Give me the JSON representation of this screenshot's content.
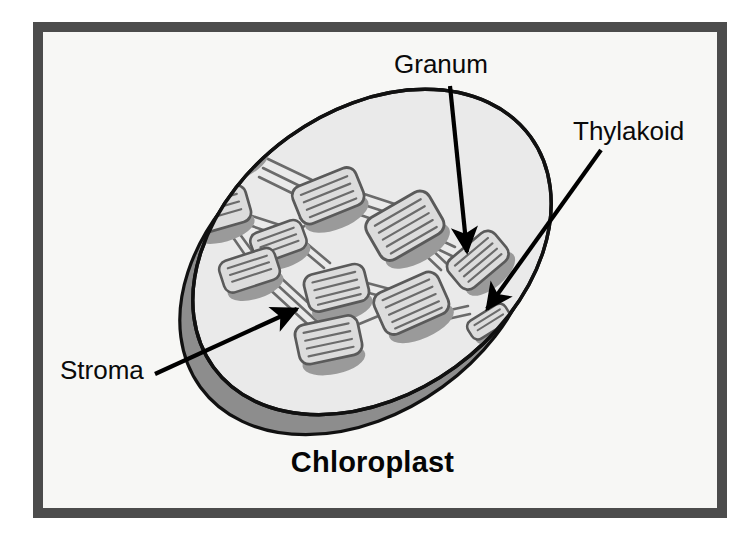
{
  "figure": {
    "title": "Chloroplast",
    "caption": "Chloroplast",
    "frame": {
      "border_color": "#4c4c4c",
      "background_color": "#f7f7f5",
      "page_background": "#ffffff"
    }
  },
  "labels": {
    "granum": "Granum",
    "thylakoid": "Thylakoid",
    "stroma": "Stroma"
  },
  "annotations": [
    {
      "id": "granum",
      "text": "Granum",
      "text_position": {
        "x": 394,
        "y": 50
      },
      "leader_line": {
        "from": {
          "x": 450,
          "y": 86
        },
        "to": {
          "x": 467,
          "y": 252
        }
      },
      "arrow_points_to": "granum-stack-right",
      "arrow_color": "#000000"
    },
    {
      "id": "thylakoid",
      "text": "Thylakoid",
      "text_position": {
        "x": 573,
        "y": 117
      },
      "leader_line": {
        "from": {
          "x": 601,
          "y": 150
        },
        "to": {
          "x": 487,
          "y": 309
        }
      },
      "arrow_points_to": "single-thylakoid-disc",
      "arrow_color": "#000000"
    },
    {
      "id": "stroma",
      "text": "Stroma",
      "text_position": {
        "x": 60,
        "y": 356
      },
      "leader_line": {
        "from": {
          "x": 155,
          "y": 374
        },
        "to": {
          "x": 297,
          "y": 309
        }
      },
      "arrow_points_to": "stroma-interior-fluid",
      "arrow_color": "#000000"
    }
  ],
  "colors": {
    "outline": "#111111",
    "body_top_fill": "#eaeaea",
    "body_rim_fill": "#8d8d8d",
    "granum_fill": "#dcdcdc",
    "granum_shadow": "#9a9a9a",
    "granum_outline": "#5a5a5a",
    "lamellae": "#6b6b6b",
    "text": "#0a0a0a"
  },
  "structure": {
    "organelle": "chloroplast",
    "shape": "tilted-ellipse-disc",
    "parts": [
      {
        "name": "outer membrane",
        "description": "smooth oval envelope outline"
      },
      {
        "name": "stroma",
        "description": "light gray fluid filling the interior"
      },
      {
        "name": "granum",
        "description": "stack of thylakoid discs"
      },
      {
        "name": "thylakoid",
        "description": "individual flattened membrane sac"
      },
      {
        "name": "lamella",
        "description": "tube connecting grana stacks"
      }
    ],
    "granum_count": 11
  }
}
